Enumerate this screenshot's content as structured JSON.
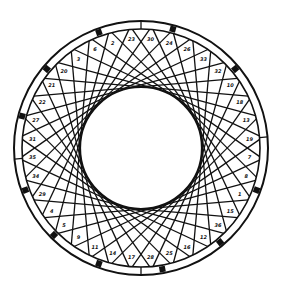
{
  "diagram": {
    "type": "string-art-ring",
    "canvas": {
      "width": 285,
      "height": 294,
      "background": "#ffffff"
    },
    "center": {
      "x": 141,
      "y": 148
    },
    "outer_radius": 127,
    "ring_inner_radius": 119,
    "hole_radius": 61,
    "divisions": 36,
    "chord_step": 11,
    "stroke_color": "#111111",
    "start_angle_deg": -90,
    "ring_ticks_deg": [
      -90,
      90,
      -5,
      175
    ],
    "markers_deg": [
      -75,
      -40,
      20,
      50,
      80,
      110,
      135,
      160,
      195,
      220,
      250
    ],
    "cell_labels": [
      "30",
      "24",
      "26",
      "33",
      "32",
      "10",
      "18",
      "13",
      "19",
      "7",
      "8",
      "1",
      "15",
      "36",
      "12",
      "16",
      "25",
      "28",
      "17",
      "14",
      "11",
      "9",
      "5",
      "4",
      "29",
      "34",
      "35",
      "31",
      "27",
      "22",
      "21",
      "20",
      "3",
      "6",
      "2",
      "23"
    ]
  }
}
